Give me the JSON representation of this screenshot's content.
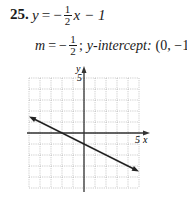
{
  "problem": {
    "number": "25.",
    "equation": {
      "lhs": "y",
      "eq": "=",
      "sign": "−",
      "frac_num": "1",
      "frac_den": "2",
      "rest": "x − 1"
    },
    "slope_line": {
      "m": "m",
      "eq": "=",
      "sign": "−",
      "frac_num": "1",
      "frac_den": "2",
      "sep": ";",
      "intercept_label": "y-intercept:",
      "intercept_value": "(0, −1)"
    }
  },
  "graph": {
    "x_axis_label": "x",
    "y_axis_label": "y",
    "x_tick_label": "5",
    "y_tick_label": "5"
  },
  "chart_data": {
    "type": "line",
    "xlabel": "x",
    "ylabel": "y",
    "xlim": [
      -5,
      5
    ],
    "ylim": [
      -5,
      5
    ],
    "grid": true,
    "series": [
      {
        "name": "y = -1/2 x - 1",
        "x": [
          -5,
          5
        ],
        "y": [
          1.5,
          -3.5
        ],
        "slope": -0.5,
        "intercept": -1,
        "arrows_both_ends": true
      }
    ],
    "tick_labels": {
      "x": [
        "5"
      ],
      "y": [
        "5"
      ]
    }
  }
}
